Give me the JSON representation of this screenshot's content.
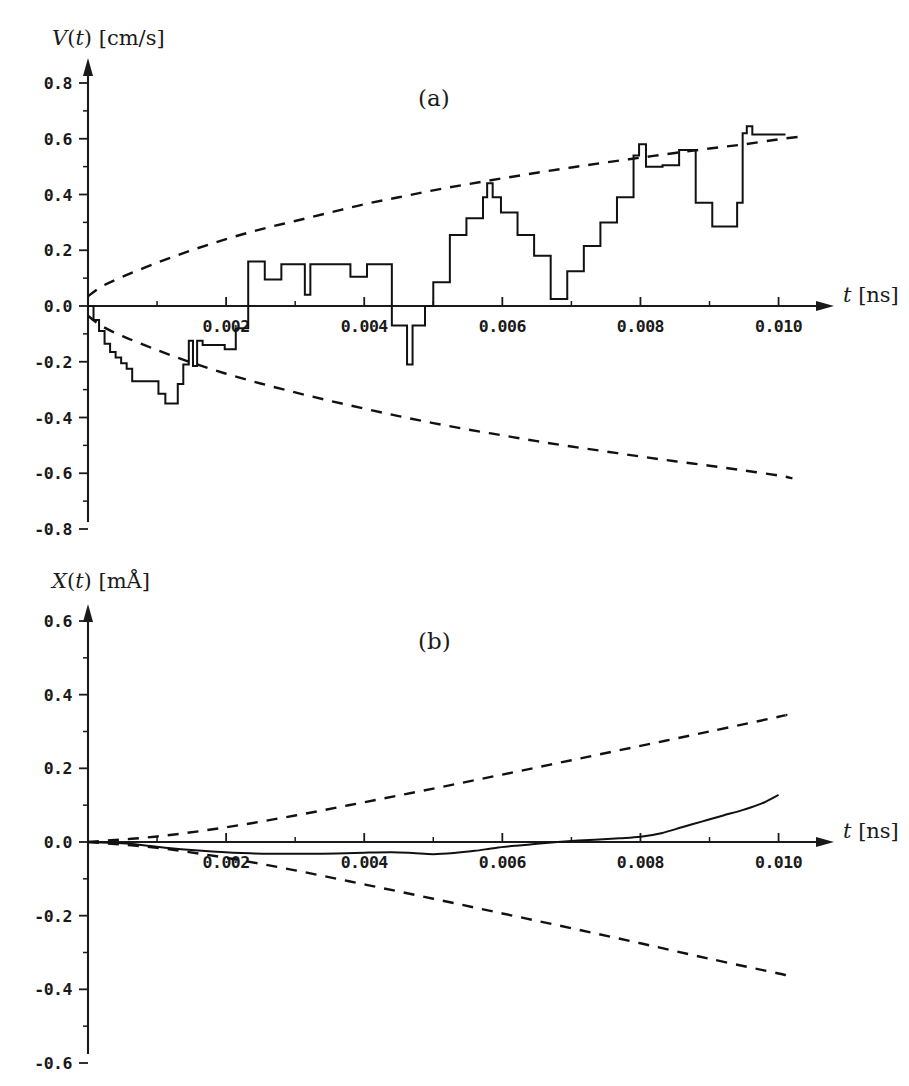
{
  "figure": {
    "background": "#ffffff",
    "ink_color": "#111111",
    "panels": [
      {
        "tag": "(a)",
        "tag_x": 430,
        "tag_y": 100,
        "y_axis_title_parts": {
          "var": "V",
          "arg": "(t)",
          "unit": "[cm/s]"
        },
        "y_axis_title_plain": "V(t) [cm/s]",
        "x_axis_title_parts": {
          "var": "t",
          "unit": "[ns]"
        },
        "x_axis_title_plain": "t [ns]"
      },
      {
        "tag": "(b)",
        "tag_x": 430,
        "tag_y": 100,
        "y_axis_title_parts": {
          "var": "X",
          "arg": "(t)",
          "unit": "[mÅ]"
        },
        "y_axis_title_plain": "X(t) [mÅ]",
        "x_axis_title_parts": {
          "var": "t",
          "unit": "[ns]"
        },
        "x_axis_title_plain": "t [ns]"
      }
    ]
  },
  "chart_data": [
    {
      "id": "panel-a",
      "type": "line",
      "title": "(a)",
      "xlabel": "t [ns]",
      "ylabel": "V(t) [cm/s]",
      "xlim": [
        0.0,
        0.0106
      ],
      "ylim": [
        -0.8,
        0.8
      ],
      "xticks": [
        0.002,
        0.004,
        0.006,
        0.008,
        0.01
      ],
      "xtick_labels": [
        "0.002",
        "0.004",
        "0.006",
        "0.008",
        "0.010"
      ],
      "x_minor_ticks": [
        0.001,
        0.003,
        0.005,
        0.007,
        0.009
      ],
      "yticks": [
        -0.8,
        -0.6,
        -0.4,
        -0.2,
        0.0,
        0.2,
        0.4,
        0.6,
        0.8
      ],
      "ytick_labels": [
        "-0.8",
        "-0.6",
        "-0.4",
        "-0.2",
        "0.0",
        "0.2",
        "0.4",
        "0.6",
        "0.8"
      ],
      "y_minor_ticks": [
        -0.7,
        -0.5,
        -0.3,
        -0.1,
        0.1,
        0.3,
        0.5,
        0.7
      ],
      "grid": false,
      "legend": "none",
      "series": [
        {
          "name": "velocity-trajectory",
          "style": "solid-step",
          "step": "post",
          "x": [
            0.0,
            8e-05,
            0.00016,
            0.00024,
            0.00032,
            0.0004,
            0.00048,
            0.00056,
            0.00064,
            0.00072,
            0.00082,
            0.00092,
            0.00102,
            0.00112,
            0.00122,
            0.0013,
            0.00138,
            0.00146,
            0.00152,
            0.00158,
            0.00166,
            0.00174,
            0.00182,
            0.0019,
            0.00198,
            0.00206,
            0.00214,
            0.00222,
            0.00232,
            0.00244,
            0.00256,
            0.00268,
            0.0028,
            0.00292,
            0.00304,
            0.00314,
            0.00322,
            0.0033,
            0.00338,
            0.00346,
            0.00356,
            0.00368,
            0.0038,
            0.00392,
            0.00404,
            0.00416,
            0.00428,
            0.0044,
            0.00452,
            0.00462,
            0.0047,
            0.00478,
            0.00488,
            0.005,
            0.00512,
            0.00524,
            0.00536,
            0.00548,
            0.0056,
            0.00572,
            0.00578,
            0.00586,
            0.00598,
            0.0061,
            0.00622,
            0.00634,
            0.00646,
            0.00658,
            0.0067,
            0.00682,
            0.00694,
            0.00706,
            0.00718,
            0.0073,
            0.00742,
            0.00754,
            0.00766,
            0.00778,
            0.0079,
            0.00798,
            0.00808,
            0.0082,
            0.00832,
            0.00844,
            0.00856,
            0.00868,
            0.0088,
            0.00892,
            0.00904,
            0.00916,
            0.00928,
            0.0094,
            0.00948,
            0.00954,
            0.00962,
            0.0098,
            0.0101
          ],
          "y": [
            0.0,
            -0.05,
            -0.09,
            -0.135,
            -0.165,
            -0.185,
            -0.205,
            -0.225,
            -0.27,
            -0.27,
            -0.27,
            -0.27,
            -0.315,
            -0.35,
            -0.35,
            -0.28,
            -0.21,
            -0.125,
            -0.215,
            -0.125,
            -0.14,
            -0.14,
            -0.14,
            -0.14,
            -0.155,
            -0.155,
            -0.08,
            -0.08,
            0.16,
            0.16,
            0.095,
            0.095,
            0.15,
            0.15,
            0.15,
            0.04,
            0.15,
            0.15,
            0.15,
            0.15,
            0.15,
            0.15,
            0.105,
            0.105,
            0.15,
            0.15,
            0.15,
            -0.07,
            -0.07,
            -0.21,
            -0.07,
            -0.07,
            0.0,
            0.085,
            0.085,
            0.255,
            0.255,
            0.315,
            0.315,
            0.39,
            0.44,
            0.39,
            0.335,
            0.335,
            0.255,
            0.255,
            0.18,
            0.18,
            0.025,
            0.025,
            0.125,
            0.125,
            0.215,
            0.215,
            0.3,
            0.3,
            0.39,
            0.39,
            0.54,
            0.58,
            0.5,
            0.5,
            0.505,
            0.505,
            0.56,
            0.56,
            0.37,
            0.37,
            0.285,
            0.285,
            0.285,
            0.37,
            0.62,
            0.645,
            0.615,
            0.615,
            0.615
          ]
        },
        {
          "name": "upper-envelope",
          "style": "dashed",
          "description": "positive diffusion envelope, concave, from 0.04 at t=0 rising to 0.61 at t=0.010",
          "x": [
            0.0,
            0.0002,
            0.0005,
            0.001,
            0.0015,
            0.002,
            0.0025,
            0.003,
            0.0035,
            0.004,
            0.0045,
            0.005,
            0.0055,
            0.006,
            0.0065,
            0.007,
            0.0075,
            0.008,
            0.0085,
            0.009,
            0.0095,
            0.01,
            0.0104
          ],
          "y": [
            0.035,
            0.07,
            0.105,
            0.155,
            0.2,
            0.24,
            0.275,
            0.305,
            0.335,
            0.365,
            0.39,
            0.415,
            0.437,
            0.458,
            0.478,
            0.497,
            0.515,
            0.532,
            0.549,
            0.565,
            0.58,
            0.598,
            0.61
          ]
        },
        {
          "name": "lower-envelope",
          "style": "dashed",
          "description": "negative diffusion envelope, mirror of upper, from -0.04 at t=0 to -0.62 at t=0.010",
          "x": [
            0.0,
            0.0002,
            0.0005,
            0.001,
            0.0015,
            0.002,
            0.0025,
            0.003,
            0.0035,
            0.004,
            0.0045,
            0.005,
            0.0055,
            0.006,
            0.0065,
            0.007,
            0.0075,
            0.008,
            0.0085,
            0.009,
            0.0095,
            0.01,
            0.0102
          ],
          "y": [
            -0.035,
            -0.072,
            -0.108,
            -0.158,
            -0.203,
            -0.243,
            -0.278,
            -0.31,
            -0.34,
            -0.368,
            -0.395,
            -0.42,
            -0.443,
            -0.464,
            -0.485,
            -0.504,
            -0.522,
            -0.54,
            -0.557,
            -0.573,
            -0.59,
            -0.608,
            -0.618
          ]
        }
      ]
    },
    {
      "id": "panel-b",
      "type": "line",
      "title": "(b)",
      "xlabel": "t [ns]",
      "ylabel": "X(t) [mÅ]",
      "xlim": [
        0.0,
        0.0106
      ],
      "ylim": [
        -0.6,
        0.6
      ],
      "xticks": [
        0.002,
        0.004,
        0.006,
        0.008,
        0.01
      ],
      "xtick_labels": [
        "0.002",
        "0.004",
        "0.006",
        "0.008",
        "0.010"
      ],
      "x_minor_ticks": [
        0.001,
        0.003,
        0.005,
        0.007,
        0.009
      ],
      "yticks": [
        -0.6,
        -0.4,
        -0.2,
        0.0,
        0.2,
        0.4,
        0.6
      ],
      "ytick_labels": [
        "-0.6",
        "-0.4",
        "-0.2",
        "0.0",
        "0.2",
        "0.4",
        "0.6"
      ],
      "y_minor_ticks": [
        -0.5,
        -0.3,
        -0.1,
        0.1,
        0.3,
        0.5
      ],
      "grid": false,
      "legend": "none",
      "series": [
        {
          "name": "position-trajectory",
          "style": "solid",
          "description": "integrated displacement: dips slightly negative to about -0.032 near t=0.0035 then rises to 0.128 at t=0.010",
          "x": [
            0.0,
            0.0003,
            0.0006,
            0.0009,
            0.0012,
            0.0015,
            0.0018,
            0.0021,
            0.0024,
            0.0027,
            0.003,
            0.0033,
            0.0036,
            0.004,
            0.0044,
            0.0047,
            0.005,
            0.0053,
            0.0056,
            0.0059,
            0.0062,
            0.0065,
            0.0068,
            0.0071,
            0.0074,
            0.0077,
            0.008,
            0.0083,
            0.0086,
            0.0089,
            0.0092,
            0.0095,
            0.00975,
            0.01
          ],
          "y": [
            0.0,
            -0.002,
            -0.005,
            -0.011,
            -0.017,
            -0.022,
            -0.026,
            -0.029,
            -0.031,
            -0.032,
            -0.032,
            -0.032,
            -0.031,
            -0.029,
            -0.028,
            -0.03,
            -0.033,
            -0.03,
            -0.024,
            -0.016,
            -0.01,
            -0.005,
            0.0,
            0.004,
            0.007,
            0.01,
            0.014,
            0.024,
            0.04,
            0.056,
            0.072,
            0.088,
            0.104,
            0.128
          ]
        },
        {
          "name": "upper-envelope",
          "style": "dashed",
          "description": "near-linear positive envelope from 0 to about 0.345 at t=0.0101",
          "x": [
            0.0,
            0.001,
            0.002,
            0.003,
            0.004,
            0.005,
            0.006,
            0.007,
            0.008,
            0.009,
            0.01,
            0.0101
          ],
          "y": [
            0.0,
            0.015,
            0.04,
            0.072,
            0.108,
            0.145,
            0.183,
            0.222,
            0.261,
            0.3,
            0.34,
            0.345
          ]
        },
        {
          "name": "lower-envelope",
          "style": "dashed",
          "description": "near-linear negative envelope from 0 to about -0.362 at t=0.0101",
          "x": [
            0.0,
            0.001,
            0.002,
            0.003,
            0.004,
            0.005,
            0.006,
            0.007,
            0.008,
            0.009,
            0.01,
            0.0101
          ],
          "y": [
            0.0,
            -0.016,
            -0.043,
            -0.077,
            -0.115,
            -0.154,
            -0.194,
            -0.234,
            -0.275,
            -0.317,
            -0.357,
            -0.362
          ]
        }
      ]
    }
  ]
}
